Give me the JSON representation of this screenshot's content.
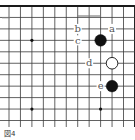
{
  "diagram": {
    "type": "go-board-fragment",
    "caption": "図4",
    "grid": {
      "origin_x": 9,
      "origin_y": 6,
      "spacing": 11.45,
      "cols": 12,
      "rows": 11,
      "top_edge": true,
      "right_edge": true,
      "line_color": "#3a3a3a",
      "edge_color": "#1a1a1a"
    },
    "star_points": [
      {
        "col": 2,
        "row": 3
      },
      {
        "col": 2,
        "row": 9
      },
      {
        "col": 8,
        "row": 9
      }
    ],
    "stones": [
      {
        "color": "black",
        "col": 8,
        "row": 3
      },
      {
        "color": "white",
        "col": 9,
        "row": 5
      },
      {
        "color": "black",
        "col": 9,
        "row": 7
      }
    ],
    "labels": [
      {
        "text": "a",
        "col": 9,
        "row": 2
      },
      {
        "text": "b",
        "col": 6,
        "row": 2
      },
      {
        "text": "c",
        "col": 6,
        "row": 3
      },
      {
        "text": "d",
        "col": 7,
        "row": 5
      },
      {
        "text": "e",
        "col": 8,
        "row": 7
      }
    ],
    "colors": {
      "black_stone": "#111111",
      "white_stone": "#ffffff",
      "label": "#555555"
    }
  }
}
